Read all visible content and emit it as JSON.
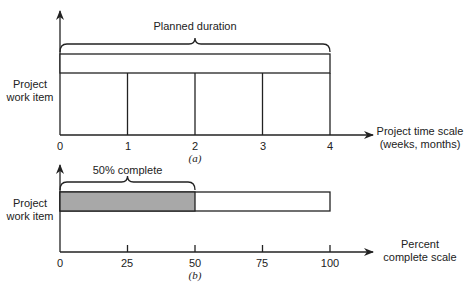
{
  "diagram_a": {
    "caption": "(a)",
    "y_label_line1": "Project",
    "y_label_line2": "work item",
    "brace_label": "Planned duration",
    "x_axis_label_line1": "Project time scale",
    "x_axis_label_line2": "(weeks, months)",
    "ticks": [
      "0",
      "1",
      "2",
      "3",
      "4"
    ],
    "planned_start": 0,
    "planned_end": 4
  },
  "diagram_b": {
    "caption": "(b)",
    "y_label_line1": "Project",
    "y_label_line2": "work item",
    "brace_label": "50% complete",
    "x_axis_label_line1": "Percent",
    "x_axis_label_line2": "complete scale",
    "ticks": [
      "0",
      "25",
      "50",
      "75",
      "100"
    ],
    "percent_complete": 50,
    "scale_max": 100,
    "fill_color": "#a8a8a8"
  }
}
